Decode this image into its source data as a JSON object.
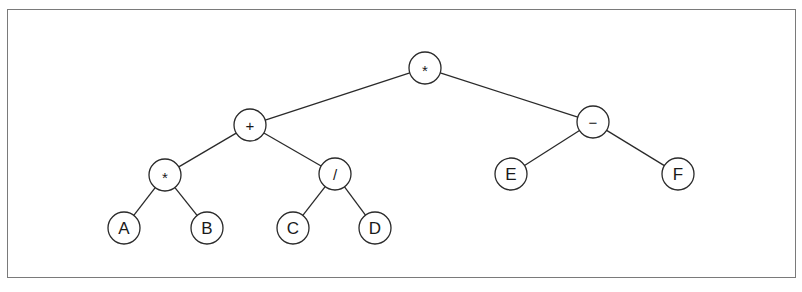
{
  "diagram": {
    "type": "expression-tree",
    "node_radius": 16,
    "colors": {
      "stroke": "#2a2a2a",
      "frame": "#7a7a7a",
      "background": "#ffffff"
    },
    "nodes": [
      {
        "id": "n_root",
        "label": "*",
        "kind": "operator",
        "x": 425,
        "y": 68
      },
      {
        "id": "n_plus",
        "label": "+",
        "kind": "operator",
        "x": 250,
        "y": 125
      },
      {
        "id": "n_minus",
        "label": "−",
        "kind": "operator",
        "x": 593,
        "y": 122
      },
      {
        "id": "n_mul2",
        "label": "*",
        "kind": "operator",
        "x": 165,
        "y": 175
      },
      {
        "id": "n_div",
        "label": "/",
        "kind": "operator",
        "x": 335,
        "y": 174
      },
      {
        "id": "n_E",
        "label": "E",
        "kind": "operand",
        "x": 511,
        "y": 174
      },
      {
        "id": "n_F",
        "label": "F",
        "kind": "operand",
        "x": 678,
        "y": 174
      },
      {
        "id": "n_A",
        "label": "A",
        "kind": "operand",
        "x": 124,
        "y": 228
      },
      {
        "id": "n_B",
        "label": "B",
        "kind": "operand",
        "x": 207,
        "y": 228
      },
      {
        "id": "n_C",
        "label": "C",
        "kind": "operand",
        "x": 293,
        "y": 228
      },
      {
        "id": "n_D",
        "label": "D",
        "kind": "operand",
        "x": 375,
        "y": 228
      }
    ],
    "edges": [
      {
        "from": "n_root",
        "to": "n_plus"
      },
      {
        "from": "n_root",
        "to": "n_minus"
      },
      {
        "from": "n_plus",
        "to": "n_mul2"
      },
      {
        "from": "n_plus",
        "to": "n_div"
      },
      {
        "from": "n_minus",
        "to": "n_E"
      },
      {
        "from": "n_minus",
        "to": "n_F"
      },
      {
        "from": "n_mul2",
        "to": "n_A"
      },
      {
        "from": "n_mul2",
        "to": "n_B"
      },
      {
        "from": "n_div",
        "to": "n_C"
      },
      {
        "from": "n_div",
        "to": "n_D"
      }
    ]
  }
}
